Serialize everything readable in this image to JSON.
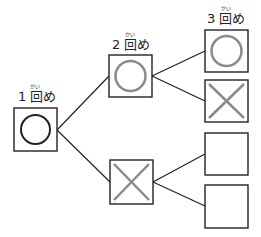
{
  "diagram": {
    "type": "tree",
    "levels": [
      {
        "number": "1",
        "kanji": "回",
        "suffix": "め",
        "ruby": "かい"
      },
      {
        "number": "2",
        "kanji": "回",
        "suffix": "め",
        "ruby": "かい"
      },
      {
        "number": "3",
        "kanji": "回",
        "suffix": "め",
        "ruby": "かい"
      }
    ],
    "nodes": [
      {
        "id": "n1",
        "level": 1,
        "mark": "circle",
        "color": "#222222"
      },
      {
        "id": "n2a",
        "level": 2,
        "mark": "circle",
        "color": "#8a8a8a"
      },
      {
        "id": "n2b",
        "level": 2,
        "mark": "cross",
        "color": "#8a8a8a"
      },
      {
        "id": "n3a",
        "level": 3,
        "mark": "circle",
        "color": "#8a8a8a"
      },
      {
        "id": "n3b",
        "level": 3,
        "mark": "cross",
        "color": "#8a8a8a"
      },
      {
        "id": "n3c",
        "level": 3,
        "mark": "empty"
      },
      {
        "id": "n3d",
        "level": 3,
        "mark": "empty"
      }
    ],
    "edges": [
      [
        "n1",
        "n2a"
      ],
      [
        "n1",
        "n2b"
      ],
      [
        "n2a",
        "n3a"
      ],
      [
        "n2a",
        "n3b"
      ],
      [
        "n2b",
        "n3c"
      ],
      [
        "n2b",
        "n3d"
      ]
    ]
  }
}
